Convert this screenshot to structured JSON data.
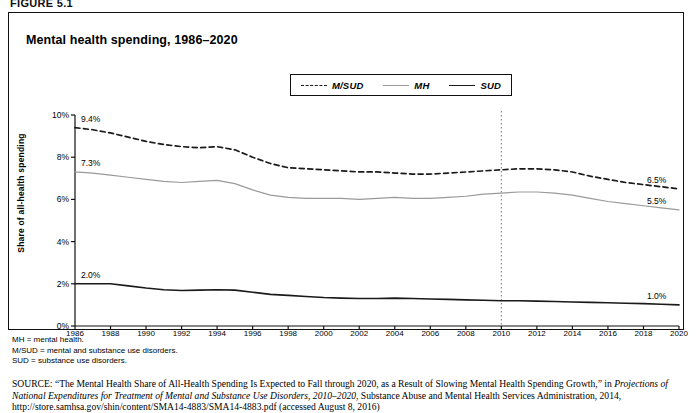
{
  "figure_label": "FIGURE 5.1",
  "chart_title": "Mental health spending, 1986–2020",
  "legend": {
    "items": [
      {
        "label": "M/SUD",
        "style": "dashed",
        "color": "#1a1a1a",
        "icon": "dashed-line-icon"
      },
      {
        "label": "MH",
        "style": "solid",
        "color": "#9a9a9a",
        "icon": "solid-line-icon"
      },
      {
        "label": "SUD",
        "style": "solid",
        "color": "#1a1a1a",
        "icon": "solid-line-icon"
      }
    ]
  },
  "notes": [
    "MH = mental health.",
    "M/SUD = mental and substance use disorders.",
    "SUD = substance use disorders."
  ],
  "source": {
    "prefix": "SOURCE:",
    "part1": " “The Mental Health Share of All-Health Spending Is Expected to Fall through 2020, as a Result of Slowing Mental Health Spending Growth,” in ",
    "italic1": "Projections of National Expenditures for Treatment of Mental and Substance Use Disorders, 2010–2020",
    "part2": ", Substance Abuse and Mental Health Services Administration, 2014, http://store.samhsa.gov/shin/content/SMA14-4883/SMA14-4883.pdf (accessed August 8, 2016)"
  },
  "chart_data": {
    "type": "line",
    "title": "Mental health spending, 1986–2020",
    "xlabel": "",
    "ylabel": "Share of all-health spending",
    "xlim": [
      1986,
      2020
    ],
    "ylim": [
      0,
      10
    ],
    "ytick_labels": [
      "0%",
      "2%",
      "4%",
      "6%",
      "8%",
      "10%"
    ],
    "ytick_values": [
      0,
      2,
      4,
      6,
      8,
      10
    ],
    "grid": false,
    "legend_position": "top-center",
    "annotations": [
      {
        "text": "9.4%",
        "series": "M/SUD",
        "x": 1986,
        "y": 9.4,
        "position": "start"
      },
      {
        "text": "7.3%",
        "series": "MH",
        "x": 1986,
        "y": 7.3,
        "position": "start"
      },
      {
        "text": "2.0%",
        "series": "SUD",
        "x": 1986,
        "y": 2.0,
        "position": "start"
      },
      {
        "text": "6.5%",
        "series": "M/SUD",
        "x": 2020,
        "y": 6.5,
        "position": "end"
      },
      {
        "text": "5.5%",
        "series": "MH",
        "x": 2020,
        "y": 5.5,
        "position": "end"
      },
      {
        "text": "1.0%",
        "series": "SUD",
        "x": 2020,
        "y": 1.0,
        "position": "end"
      }
    ],
    "reference_line": {
      "x": 2010,
      "style": "dotted",
      "label": ""
    },
    "x": [
      1986,
      1987,
      1988,
      1989,
      1990,
      1991,
      1992,
      1993,
      1994,
      1995,
      1996,
      1997,
      1998,
      1999,
      2000,
      2001,
      2002,
      2003,
      2004,
      2005,
      2006,
      2007,
      2008,
      2009,
      2010,
      2011,
      2012,
      2013,
      2014,
      2015,
      2016,
      2017,
      2018,
      2019,
      2020
    ],
    "xtick_labels": [
      "1986",
      "1988",
      "1990",
      "1992",
      "1994",
      "1996",
      "1998",
      "2000",
      "2002",
      "2004",
      "2006",
      "2008",
      "2010",
      "2012",
      "2014",
      "2016",
      "2018",
      "2020"
    ],
    "series": [
      {
        "name": "M/SUD",
        "style": "dashed",
        "color": "#1a1a1a",
        "values": [
          9.4,
          9.3,
          9.15,
          8.95,
          8.75,
          8.6,
          8.5,
          8.45,
          8.5,
          8.35,
          8.0,
          7.7,
          7.5,
          7.45,
          7.4,
          7.35,
          7.3,
          7.3,
          7.25,
          7.2,
          7.2,
          7.25,
          7.3,
          7.35,
          7.4,
          7.45,
          7.45,
          7.4,
          7.3,
          7.1,
          6.95,
          6.8,
          6.7,
          6.6,
          6.5
        ]
      },
      {
        "name": "MH",
        "style": "solid",
        "color": "#9a9a9a",
        "values": [
          7.3,
          7.25,
          7.15,
          7.05,
          6.95,
          6.85,
          6.8,
          6.85,
          6.9,
          6.75,
          6.45,
          6.2,
          6.1,
          6.05,
          6.05,
          6.05,
          6.0,
          6.05,
          6.1,
          6.05,
          6.05,
          6.1,
          6.15,
          6.25,
          6.3,
          6.35,
          6.35,
          6.3,
          6.2,
          6.05,
          5.9,
          5.8,
          5.7,
          5.6,
          5.5
        ]
      },
      {
        "name": "SUD",
        "style": "solid",
        "color": "#1a1a1a",
        "values": [
          2.0,
          2.0,
          2.0,
          1.9,
          1.8,
          1.72,
          1.68,
          1.7,
          1.72,
          1.7,
          1.6,
          1.5,
          1.45,
          1.4,
          1.35,
          1.32,
          1.3,
          1.3,
          1.32,
          1.3,
          1.28,
          1.26,
          1.24,
          1.22,
          1.2,
          1.2,
          1.18,
          1.16,
          1.14,
          1.12,
          1.1,
          1.08,
          1.06,
          1.03,
          1.0
        ]
      }
    ]
  }
}
